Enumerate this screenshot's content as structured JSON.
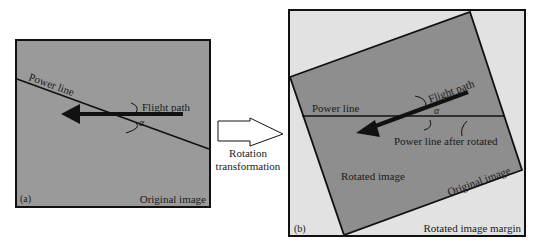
{
  "colors": {
    "image_fill": "#9a9a9a",
    "margin_fill": "#e2e2e2",
    "line": "#111111"
  },
  "panel_a": {
    "tag": "(a)",
    "power_line": "Power line",
    "flight_path": "Flight path",
    "angle": "α",
    "corner_label": "Original image"
  },
  "transition": {
    "line1": "Rotation",
    "line2": "transformation"
  },
  "panel_b": {
    "tag": "(b)",
    "power_line": "Power line",
    "flight_path": "Flight path",
    "angle": "α",
    "power_line_after": "Power line after rotated",
    "rotated_image": "Rotated image",
    "original_image": "Original image",
    "margin_label": "Rotated image margin"
  }
}
